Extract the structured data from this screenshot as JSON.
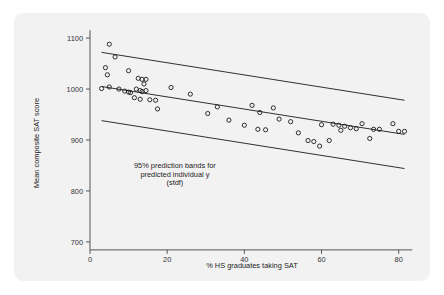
{
  "panel": {
    "background_color": "#f2f2f2",
    "page_background_color": "#ffffff"
  },
  "chart_data": {
    "type": "scatter",
    "title": "",
    "xlabel": "% HS graduates taking SAT",
    "ylabel": "Mean composite SAT score",
    "xlim": [
      0,
      85
    ],
    "ylim": [
      690,
      1110
    ],
    "xticks": [
      0,
      20,
      40,
      60,
      80
    ],
    "yticks": [
      700,
      800,
      900,
      1000,
      1100
    ],
    "grid": false,
    "legend": null,
    "annotations": [
      "95% prediction bands for",
      "predicted individual y",
      "(stdf)"
    ],
    "annotation_x": 22,
    "annotation_y": [
      845,
      828,
      811
    ],
    "marker": "open-circle",
    "marker_color": "#1a1a1a",
    "points": [
      {
        "x": 5.0,
        "y": 1088
      },
      {
        "x": 6.5,
        "y": 1063
      },
      {
        "x": 4.0,
        "y": 1042
      },
      {
        "x": 4.5,
        "y": 1028
      },
      {
        "x": 10.0,
        "y": 1036
      },
      {
        "x": 12.5,
        "y": 1021
      },
      {
        "x": 13.5,
        "y": 1019
      },
      {
        "x": 14.5,
        "y": 1019
      },
      {
        "x": 14.0,
        "y": 1010
      },
      {
        "x": 3.0,
        "y": 1001
      },
      {
        "x": 5.0,
        "y": 1004
      },
      {
        "x": 7.5,
        "y": 1000
      },
      {
        "x": 9.0,
        "y": 996
      },
      {
        "x": 10.0,
        "y": 994
      },
      {
        "x": 10.5,
        "y": 993
      },
      {
        "x": 12.0,
        "y": 1000
      },
      {
        "x": 13.0,
        "y": 997
      },
      {
        "x": 13.5,
        "y": 995
      },
      {
        "x": 14.5,
        "y": 997
      },
      {
        "x": 11.5,
        "y": 983
      },
      {
        "x": 13.0,
        "y": 980
      },
      {
        "x": 15.5,
        "y": 979
      },
      {
        "x": 17.0,
        "y": 978
      },
      {
        "x": 21.0,
        "y": 1003
      },
      {
        "x": 26.0,
        "y": 990
      },
      {
        "x": 17.5,
        "y": 961
      },
      {
        "x": 33.0,
        "y": 965
      },
      {
        "x": 36.0,
        "y": 939
      },
      {
        "x": 42.0,
        "y": 968
      },
      {
        "x": 44.0,
        "y": 954
      },
      {
        "x": 47.5,
        "y": 963
      },
      {
        "x": 49.0,
        "y": 941
      },
      {
        "x": 40.0,
        "y": 929
      },
      {
        "x": 43.5,
        "y": 921
      },
      {
        "x": 45.5,
        "y": 920
      },
      {
        "x": 52.0,
        "y": 936
      },
      {
        "x": 54.0,
        "y": 914
      },
      {
        "x": 56.5,
        "y": 899
      },
      {
        "x": 58.0,
        "y": 897
      },
      {
        "x": 59.5,
        "y": 888
      },
      {
        "x": 60.0,
        "y": 930
      },
      {
        "x": 63.0,
        "y": 931
      },
      {
        "x": 64.5,
        "y": 929
      },
      {
        "x": 66.0,
        "y": 927
      },
      {
        "x": 65.0,
        "y": 919
      },
      {
        "x": 67.5,
        "y": 924
      },
      {
        "x": 69.0,
        "y": 922
      },
      {
        "x": 70.5,
        "y": 932
      },
      {
        "x": 72.5,
        "y": 903
      },
      {
        "x": 62.0,
        "y": 899
      },
      {
        "x": 73.5,
        "y": 921
      },
      {
        "x": 75.0,
        "y": 921
      },
      {
        "x": 78.5,
        "y": 932
      },
      {
        "x": 80.0,
        "y": 917
      },
      {
        "x": 81.5,
        "y": 917
      },
      {
        "x": 30.5,
        "y": 952
      }
    ],
    "bands": [
      {
        "name": "upper-prediction-band",
        "x1": 3.0,
        "y1": 1072,
        "x2": 81.5,
        "y2": 978
      },
      {
        "name": "fitted-regression-line",
        "x1": 3.0,
        "y1": 1005,
        "x2": 81.5,
        "y2": 911
      },
      {
        "name": "lower-prediction-band",
        "x1": 3.0,
        "y1": 938,
        "x2": 81.5,
        "y2": 844
      }
    ]
  }
}
